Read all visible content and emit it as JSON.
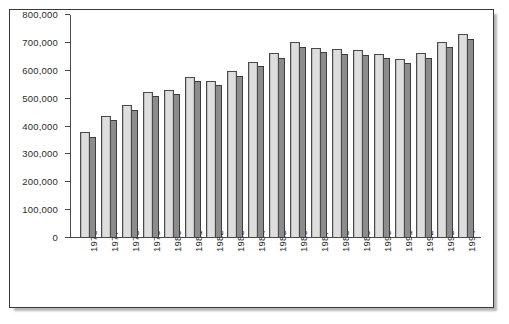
{
  "chart_data": {
    "type": "bar",
    "title": "",
    "subtitle": "",
    "xlabel": "",
    "ylabel": "",
    "ylim": [
      0,
      800000
    ],
    "ytick_labels": [
      "800,000",
      "700,000",
      "600,000",
      "500,000",
      "400,000",
      "300,000",
      "200,000",
      "100,000",
      "0"
    ],
    "ytick_values": [
      800000,
      700000,
      600000,
      500000,
      400000,
      300000,
      200000,
      100000,
      0
    ],
    "grid": false,
    "legend": null,
    "legend_position": "none",
    "categories": [
      "1976",
      "1977",
      "1978",
      "1979",
      "1980",
      "1981",
      "1982",
      "1983",
      "1984",
      "1985",
      "1986",
      "1987",
      "1988",
      "1989",
      "1990",
      "1991",
      "1992",
      "1993",
      "1994"
    ],
    "series": [
      {
        "name": "series-1",
        "color": "#d6d6d6",
        "values": [
          377000,
          437000,
          475000,
          522000,
          531000,
          578000,
          563000,
          598000,
          631000,
          662000,
          702000,
          682000,
          678000,
          673000,
          661000,
          641000,
          662000,
          702000,
          731000
        ]
      },
      {
        "name": "series-2",
        "color": "#8c8c8c",
        "values": [
          361000,
          421000,
          458000,
          507000,
          514000,
          561000,
          547000,
          582000,
          615000,
          646000,
          685000,
          667000,
          661000,
          657000,
          645000,
          626000,
          646000,
          684000,
          714000
        ]
      }
    ]
  },
  "figure": {
    "frame_color": "#3a3a3a",
    "axis_color": "#4a4a4a",
    "background": "#ffffff"
  }
}
